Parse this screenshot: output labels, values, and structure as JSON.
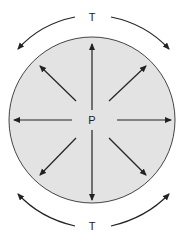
{
  "diagram": {
    "center_label": "P",
    "top_label": "T",
    "bottom_label": "T",
    "colors": {
      "fill": "#e3e3e3",
      "stroke": "#333333",
      "background": "#ffffff"
    },
    "arrows": {
      "radial_count": 8,
      "radial_direction": "outward",
      "tension_arcs": 4
    }
  }
}
